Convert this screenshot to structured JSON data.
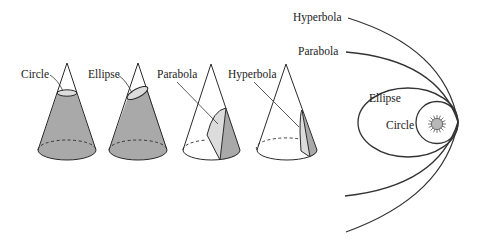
{
  "diagram": {
    "colors": {
      "background": "#ffffff",
      "line": "#2a2a2a",
      "cone_shade": "#a9a9a9",
      "section_fill": "#dcdcdc",
      "sun_fill": "#b8b8b8"
    },
    "cones": [
      {
        "label": "Circle"
      },
      {
        "label": "Ellipse"
      },
      {
        "label": "Parabola"
      },
      {
        "label": "Hyperbola"
      }
    ],
    "orbits": {
      "labels": {
        "hyperbola": "Hyperbola",
        "parabola": "Parabola",
        "ellipse": "Ellipse",
        "circle": "Circle"
      },
      "central_body": "sun-icon"
    }
  }
}
